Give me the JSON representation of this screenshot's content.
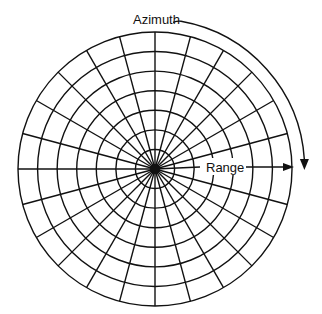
{
  "diagram": {
    "type": "polar-grid",
    "title": "",
    "labels": {
      "azimuth": "Azimuth",
      "range": "Range"
    },
    "geometry": {
      "center": [
        155,
        169
      ],
      "outer_radius": 137,
      "ring_count": 7,
      "spoke_count": 24,
      "spoke_step_deg": 15
    },
    "colors": {
      "line": "#111111",
      "background": "#ffffff"
    },
    "annotations": [
      {
        "text": "Azimuth",
        "description": "curved arrow running clockwise outside the grid from top toward the right side"
      },
      {
        "text": "Range",
        "description": "straight arrow from center outward to the right edge of the grid"
      }
    ]
  }
}
